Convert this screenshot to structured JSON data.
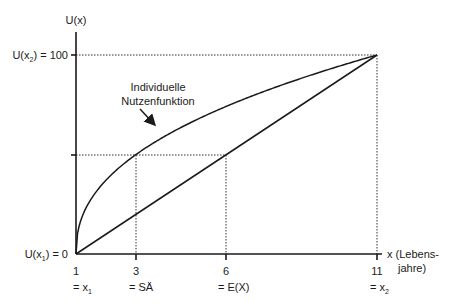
{
  "diagram": {
    "type": "utility-function",
    "y_axis": {
      "label": "U(x)",
      "top_label_main": "U(x",
      "top_label_sub": "2",
      "top_label_rest": ") = 100",
      "bottom_label_main": "U(x",
      "bottom_label_sub": "1",
      "bottom_label_rest": ") = 0"
    },
    "x_axis": {
      "label_line1": "x (Lebens-",
      "label_line2": "jahre)",
      "ticks": [
        {
          "value": "1",
          "sub_main": "= x",
          "sub_index": "1"
        },
        {
          "value": "3",
          "sub_main": "= SÄ",
          "sub_index": ""
        },
        {
          "value": "6",
          "sub_main": "= E(X)",
          "sub_index": ""
        },
        {
          "value": "11",
          "sub_main": "= x",
          "sub_index": "2"
        }
      ]
    },
    "annotation": {
      "line1": "Individuelle",
      "line2": "Nutzenfunktion"
    },
    "colors": {
      "line": "#1a1a1a",
      "dotted": "#333333",
      "background": "#ffffff"
    }
  },
  "chart_data": {
    "type": "line",
    "title": "",
    "xlabel": "x (Lebensjahre)",
    "ylabel": "U(x)",
    "xlim": [
      1,
      11
    ],
    "ylim": [
      0,
      100
    ],
    "series": [
      {
        "name": "Individuelle Nutzenfunktion",
        "x": [
          1,
          2,
          3,
          4,
          5,
          6,
          7,
          8,
          9,
          10,
          11
        ],
        "values": [
          0,
          37,
          50,
          60,
          67,
          74,
          80,
          86,
          91,
          96,
          100
        ]
      },
      {
        "name": "Lineare Nutzenfunktion",
        "x": [
          1,
          11
        ],
        "values": [
          0,
          100
        ]
      }
    ],
    "annotations": [
      {
        "label": "SÄ",
        "x": 3,
        "y": 50
      },
      {
        "label": "E(X)",
        "x": 6,
        "y": 50
      }
    ]
  }
}
